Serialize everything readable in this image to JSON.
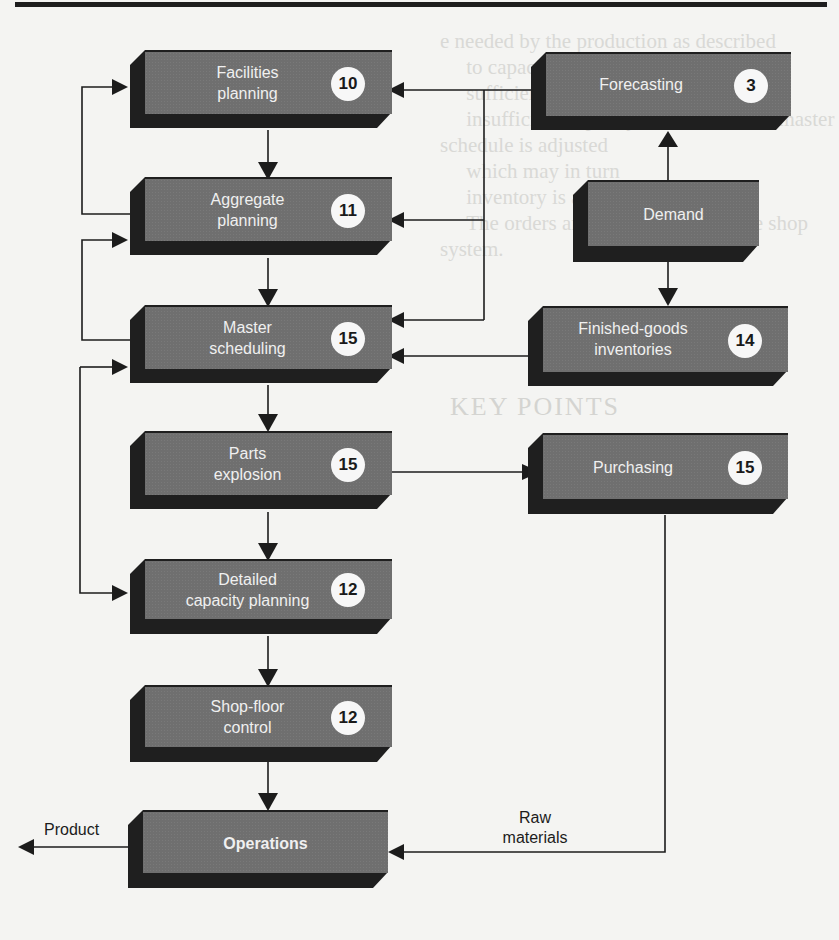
{
  "figure": {
    "type": "flowchart",
    "title": "",
    "colors": {
      "block_face": "#6f6f6f",
      "block_shadow": "#1f1f1f",
      "badge_fill": "#f7f7f7",
      "line": "#1c1c1c",
      "page": "#f4f4f2"
    }
  },
  "blocks": {
    "facilities": {
      "label_line1": "Facilities",
      "label_line2": "planning",
      "chapter": "10"
    },
    "aggregate": {
      "label_line1": "Aggregate",
      "label_line2": "planning",
      "chapter": "11"
    },
    "master": {
      "label_line1": "Master",
      "label_line2": "scheduling",
      "chapter": "15"
    },
    "parts": {
      "label_line1": "Parts",
      "label_line2": "explosion",
      "chapter": "15"
    },
    "detailed": {
      "label_line1": "Detailed",
      "label_line2": "capacity planning",
      "chapter": "12"
    },
    "shopfloor": {
      "label_line1": "Shop-floor",
      "label_line2": "control",
      "chapter": "12"
    },
    "operations": {
      "label_line1": "Operations"
    },
    "forecasting": {
      "label_line1": "Forecasting",
      "chapter": "3"
    },
    "demand": {
      "label_line1": "Demand"
    },
    "finished": {
      "label_line1": "Finished-goods",
      "label_line2": "inventories",
      "chapter": "14"
    },
    "purchasing": {
      "label_line1": "Purchasing",
      "chapter": "15"
    }
  },
  "flow_labels": {
    "product": "Product",
    "raw_line1": "Raw",
    "raw_line2": "materials"
  },
  "connections": [
    {
      "from": "Forecasting",
      "to": "Facilities planning"
    },
    {
      "from": "Forecasting",
      "to": "Aggregate planning"
    },
    {
      "from": "Forecasting",
      "to": "Master scheduling"
    },
    {
      "from": "Demand",
      "to": "Forecasting"
    },
    {
      "from": "Demand",
      "to": "Finished-goods inventories"
    },
    {
      "from": "Finished-goods inventories",
      "to": "Master scheduling"
    },
    {
      "from": "Facilities planning",
      "to": "Aggregate planning"
    },
    {
      "from": "Aggregate planning",
      "to": "Facilities planning"
    },
    {
      "from": "Aggregate planning",
      "to": "Master scheduling"
    },
    {
      "from": "Master scheduling",
      "to": "Aggregate planning"
    },
    {
      "from": "Master scheduling",
      "to": "Parts explosion"
    },
    {
      "from": "Master scheduling",
      "to": "Detailed capacity planning"
    },
    {
      "from": "Parts explosion",
      "to": "Detailed capacity planning"
    },
    {
      "from": "Parts explosion",
      "to": "Purchasing"
    },
    {
      "from": "Detailed capacity planning",
      "to": "Shop-floor control"
    },
    {
      "from": "Shop-floor control",
      "to": "Operations"
    },
    {
      "from": "Purchasing",
      "to": "Operations",
      "label": "Raw materials"
    },
    {
      "from": "Operations",
      "to": "output",
      "label": "Product"
    }
  ],
  "background_text": {
    "faded_body": "e needed by the production as described\n     to capacity. If it can be done,\n     sufficient capacity; if not, the\n     insufficient capacity is available, the master schedule is adjusted\n     which may in turn\n     inventory is available...\n     The orders are released through the shop system.",
    "faded_heading": "KEY POINTS"
  }
}
